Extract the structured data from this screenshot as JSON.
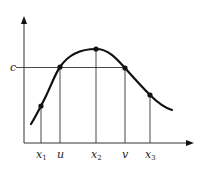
{
  "diagram": {
    "type": "function-graph",
    "colors": {
      "stroke": "#111111",
      "thin": "#333333",
      "background": "#ffffff"
    },
    "y_axis_label": "c",
    "x_labels": [
      {
        "name": "x1",
        "base": "x",
        "sub": "1",
        "x": 41
      },
      {
        "name": "u",
        "base": "u",
        "sub": "",
        "x": 60
      },
      {
        "name": "x2",
        "base": "x",
        "sub": "2",
        "x": 96
      },
      {
        "name": "v",
        "base": "v",
        "sub": "",
        "x": 125
      },
      {
        "name": "x3",
        "base": "x",
        "sub": "3",
        "x": 150
      }
    ],
    "points": [
      {
        "name": "x1",
        "x": 41,
        "y": 106
      },
      {
        "name": "u",
        "x": 60,
        "y": 67
      },
      {
        "name": "x2",
        "x": 96,
        "y": 49
      },
      {
        "name": "v",
        "x": 125,
        "y": 68
      },
      {
        "name": "x3",
        "x": 150,
        "y": 95
      }
    ]
  }
}
